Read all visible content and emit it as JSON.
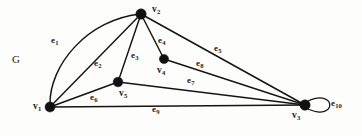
{
  "figure": {
    "name": "G",
    "graph_name_label": "G",
    "width": 362,
    "height": 136,
    "background_color": "#fdfdfb",
    "ink_color": "#141414"
  },
  "vertices": [
    {
      "id": "v1",
      "label": "v",
      "subscript": "1",
      "x": 50,
      "y": 107,
      "label_x": 33,
      "label_y": 102,
      "radius": 5.0
    },
    {
      "id": "v2",
      "label": "v",
      "subscript": "2",
      "x": 141,
      "y": 14,
      "label_x": 152,
      "label_y": 5,
      "radius": 5.2
    },
    {
      "id": "v3",
      "label": "v",
      "subscript": "3",
      "x": 305,
      "y": 105,
      "label_x": 292,
      "label_y": 111,
      "radius": 5.2
    },
    {
      "id": "v4",
      "label": "v",
      "subscript": "4",
      "x": 164,
      "y": 59,
      "label_x": 157,
      "label_y": 66,
      "radius": 4.6
    },
    {
      "id": "v5",
      "label": "v",
      "subscript": "5",
      "x": 118,
      "y": 82,
      "label_x": 119,
      "label_y": 89,
      "radius": 4.8
    }
  ],
  "edges": [
    {
      "id": "e1",
      "label": "e",
      "subscript": "1",
      "from": "v1",
      "to": "v2",
      "kind": "curve",
      "label_x": 51,
      "label_y": 36
    },
    {
      "id": "e2",
      "label": "e",
      "subscript": "2",
      "from": "v1",
      "to": "v2",
      "kind": "line",
      "label_x": 94,
      "label_y": 59
    },
    {
      "id": "e3",
      "label": "e",
      "subscript": "3",
      "from": "v5",
      "to": "v2",
      "kind": "line",
      "label_x": 131,
      "label_y": 51
    },
    {
      "id": "e4",
      "label": "e",
      "subscript": "4",
      "from": "v4",
      "to": "v2",
      "kind": "line",
      "label_x": 158,
      "label_y": 36
    },
    {
      "id": "e5",
      "label": "e",
      "subscript": "5",
      "from": "v2",
      "to": "v3",
      "kind": "line",
      "label_x": 214,
      "label_y": 44
    },
    {
      "id": "e6",
      "label": "e",
      "subscript": "6",
      "from": "v1",
      "to": "v5",
      "kind": "line",
      "label_x": 90,
      "label_y": 93
    },
    {
      "id": "e7",
      "label": "e",
      "subscript": "7",
      "from": "v5",
      "to": "v3",
      "kind": "line",
      "label_x": 187,
      "label_y": 76
    },
    {
      "id": "e8",
      "label": "e",
      "subscript": "8",
      "from": "v4",
      "to": "v3",
      "kind": "line",
      "label_x": 196,
      "label_y": 59
    },
    {
      "id": "e9",
      "label": "e",
      "subscript": "9",
      "from": "v1",
      "to": "v3",
      "kind": "line",
      "label_x": 152,
      "label_y": 105
    },
    {
      "id": "e10",
      "label": "e",
      "subscript": "10",
      "from": "v3",
      "to": "v3",
      "kind": "loop",
      "label_x": 331,
      "label_y": 99
    }
  ],
  "graph_label": {
    "text": "G",
    "x": 12,
    "y": 54
  },
  "chart_data": {
    "type": "diagram",
    "title": "G",
    "vertex_count": 5,
    "edge_count": 10,
    "vertex_names": [
      "v1",
      "v2",
      "v3",
      "v4",
      "v5"
    ],
    "edge_list": [
      [
        "e1",
        "v1",
        "v2"
      ],
      [
        "e2",
        "v1",
        "v2"
      ],
      [
        "e3",
        "v5",
        "v2"
      ],
      [
        "e4",
        "v4",
        "v2"
      ],
      [
        "e5",
        "v2",
        "v3"
      ],
      [
        "e6",
        "v1",
        "v5"
      ],
      [
        "e7",
        "v5",
        "v3"
      ],
      [
        "e8",
        "v4",
        "v3"
      ],
      [
        "e9",
        "v1",
        "v3"
      ],
      [
        "e10",
        "v3",
        "v3"
      ]
    ]
  }
}
